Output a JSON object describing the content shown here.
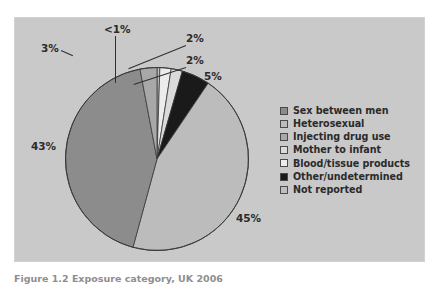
{
  "figure": {
    "panel_bg": "#c9c9c9",
    "page_bg": "#ffffff",
    "caption": "Figure 1.2 Exposure category, UK 2006"
  },
  "chart_data": {
    "type": "pie",
    "title": "",
    "subtitle": "",
    "xlabel": "",
    "ylabel": "",
    "grid": false,
    "legend_position": "right",
    "start_angle_deg": 0,
    "direction": "clockwise",
    "categories": [
      "Not reported",
      "Blood/tissue products",
      "Mother to infant",
      "Other/undetermined",
      "Heterosexual",
      "Sex between men",
      "Injecting drug use"
    ],
    "values": [
      0.5,
      2,
      2,
      5,
      45,
      43,
      3
    ],
    "labels": [
      "<1%",
      "2%",
      "2%",
      "5%",
      "45%",
      "43%",
      "3%"
    ],
    "colors": [
      "#bfbfbf",
      "#ececec",
      "#dadada",
      "#1a1a1a",
      "#bcbcbc",
      "#8c8c8c",
      "#a8a8a8"
    ],
    "slices": [
      {
        "label": "Not reported",
        "value": 0.5,
        "display": "<1%",
        "color": "#bfbfbf"
      },
      {
        "label": "Blood/tissue products",
        "value": 2,
        "display": "2%",
        "color": "#ececec"
      },
      {
        "label": "Mother to infant",
        "value": 2,
        "display": "2%",
        "color": "#dadada"
      },
      {
        "label": "Other/undetermined",
        "value": 5,
        "display": "5%",
        "color": "#1a1a1a"
      },
      {
        "label": "Heterosexual",
        "value": 45,
        "display": "45%",
        "color": "#bcbcbc"
      },
      {
        "label": "Sex between men",
        "value": 43,
        "display": "43%",
        "color": "#8c8c8c"
      },
      {
        "label": "Injecting drug use",
        "value": 3,
        "display": "3%",
        "color": "#a8a8a8"
      }
    ]
  },
  "pie_labels": {
    "three": "3%",
    "less_than_one": "<1%",
    "two_a": "2%",
    "two_b": "2%",
    "five": "5%",
    "fortythree": "43%",
    "fortyfive": "45%"
  },
  "legend": {
    "items": [
      {
        "label": "Sex between men",
        "color": "#8c8c8c"
      },
      {
        "label": "Heterosexual",
        "color": "#bcbcbc"
      },
      {
        "label": "Injecting drug use",
        "color": "#a8a8a8"
      },
      {
        "label": "Mother to infant",
        "color": "#dadada"
      },
      {
        "label": "Blood/tissue products",
        "color": "#ececec"
      },
      {
        "label": "Other/undetermined",
        "color": "#1a1a1a"
      },
      {
        "label": "Not reported",
        "color": "#bfbfbf"
      }
    ]
  }
}
